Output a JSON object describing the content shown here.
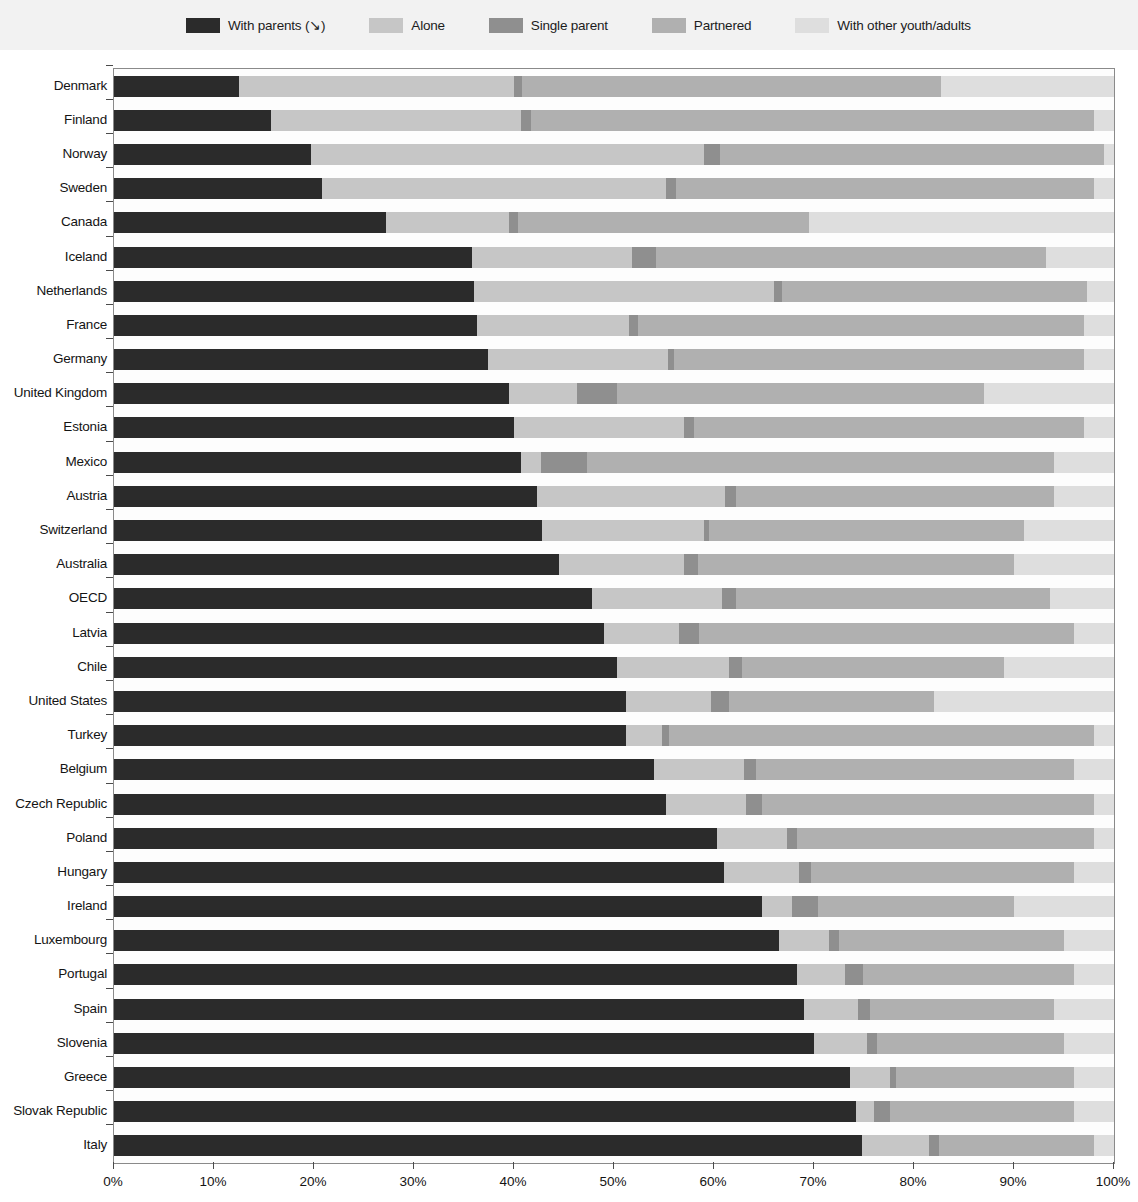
{
  "legend": {
    "items": [
      {
        "label": "With parents  (↘)",
        "color": "#2b2b2b"
      },
      {
        "label": "Alone",
        "color": "#c6c6c6"
      },
      {
        "label": "Single parent",
        "color": "#8f8f8f"
      },
      {
        "label": "Partnered",
        "color": "#b0b0b0"
      },
      {
        "label": "With other youth/adults",
        "color": "#dedede"
      }
    ]
  },
  "axis": {
    "x_ticks": [
      "0%",
      "10%",
      "20%",
      "30%",
      "40%",
      "50%",
      "60%",
      "70%",
      "80%",
      "90%",
      "100%"
    ]
  },
  "chart_data": {
    "type": "bar",
    "orientation": "horizontal",
    "stacked": true,
    "stack_mode": "percent",
    "title": "",
    "xlabel": "",
    "ylabel": "",
    "xlim": [
      0,
      100
    ],
    "xticks": [
      0,
      10,
      20,
      30,
      40,
      50,
      60,
      70,
      80,
      90,
      100
    ],
    "grid": false,
    "legend_position": "top",
    "sorted_by": "With parents (descending arrow on legend)",
    "series": [
      {
        "name": "With parents",
        "color": "#2b2b2b",
        "values": [
          12.5,
          15.7,
          19.7,
          20.8,
          27.2,
          35.8,
          36.0,
          36.3,
          37.4,
          39.5,
          40.0,
          40.7,
          42.3,
          42.8,
          44.5,
          47.8,
          49.0,
          50.3,
          51.2,
          51.2,
          54.0,
          55.2,
          60.3,
          61.0,
          64.8,
          66.5,
          68.3,
          69.0,
          70.0,
          73.6,
          74.2,
          74.8
        ]
      },
      {
        "name": "Alone",
        "color": "#c6c6c6",
        "values": [
          27.5,
          25.0,
          39.3,
          34.4,
          12.3,
          16.0,
          30.0,
          15.2,
          18.0,
          6.8,
          17.0,
          2.0,
          18.8,
          16.2,
          12.5,
          13.0,
          7.5,
          11.2,
          8.5,
          3.6,
          9.0,
          8.0,
          7.0,
          7.5,
          3.0,
          5.0,
          4.8,
          5.4,
          5.3,
          4.0,
          1.8,
          6.7
        ]
      },
      {
        "name": "Single parent",
        "color": "#8f8f8f",
        "values": [
          0.8,
          1.0,
          1.6,
          1.0,
          0.9,
          2.4,
          0.8,
          0.9,
          0.6,
          4.0,
          1.0,
          4.6,
          1.1,
          0.5,
          1.4,
          1.4,
          2.0,
          1.3,
          1.8,
          0.7,
          1.2,
          1.6,
          1.0,
          1.2,
          2.6,
          1.0,
          1.8,
          1.2,
          1.0,
          0.6,
          1.6,
          1.0
        ]
      },
      {
        "name": "Partnered",
        "color": "#b0b0b0",
        "values": [
          41.9,
          56.3,
          38.4,
          41.8,
          29.1,
          39.0,
          30.5,
          44.6,
          41.0,
          36.7,
          39.0,
          46.7,
          31.8,
          31.5,
          31.6,
          31.4,
          37.5,
          26.2,
          20.5,
          42.5,
          31.8,
          33.2,
          29.7,
          26.3,
          19.6,
          22.5,
          21.1,
          18.4,
          18.7,
          17.8,
          18.4,
          15.5
        ]
      },
      {
        "name": "With other youth/adults",
        "color": "#dedede",
        "values": [
          17.3,
          2.0,
          1.0,
          2.0,
          30.5,
          6.8,
          2.7,
          3.0,
          3.0,
          13.0,
          3.0,
          6.0,
          6.0,
          9.0,
          10.0,
          6.4,
          4.0,
          11.0,
          18.0,
          2.0,
          4.0,
          2.0,
          2.0,
          4.0,
          10.0,
          5.0,
          4.0,
          6.0,
          5.0,
          4.0,
          4.0,
          2.0
        ]
      }
    ],
    "categories": [
      "Denmark",
      "Finland",
      "Norway",
      "Sweden",
      "Canada",
      "Iceland",
      "Netherlands",
      "France",
      "Germany",
      "United Kingdom",
      "Estonia",
      "Mexico",
      "Austria",
      "Switzerland",
      "Australia",
      "OECD",
      "Latvia",
      "Chile",
      "United States",
      "Turkey",
      "Belgium",
      "Czech Republic",
      "Poland",
      "Hungary",
      "Ireland",
      "Luxembourg",
      "Portugal",
      "Spain",
      "Slovenia",
      "Greece",
      "Slovak Republic",
      "Italy"
    ]
  }
}
